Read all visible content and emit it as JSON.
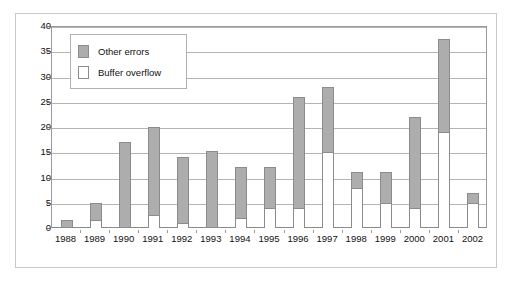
{
  "chart_data": {
    "type": "bar",
    "title": "",
    "xlabel": "",
    "ylabel": "",
    "stacked": true,
    "grid": true,
    "legend_position": "top-left-inside",
    "ylim": [
      0,
      40
    ],
    "ytick_step": 5,
    "yticks": [
      "0",
      "5",
      "10",
      "15",
      "20",
      "25",
      "30",
      "35",
      "40"
    ],
    "categories": [
      "1988",
      "1989",
      "1990",
      "1991",
      "1992",
      "1993",
      "1994",
      "1995",
      "1996",
      "1997",
      "1998",
      "1999",
      "2000",
      "2001",
      "2002"
    ],
    "series": [
      {
        "name": "Buffer overflow",
        "color": "#ffffff",
        "values": [
          0,
          1.5,
          0,
          2.5,
          1,
          0,
          2,
          4,
          4,
          15,
          8,
          5,
          4,
          19,
          5
        ]
      },
      {
        "name": "Other errors",
        "color": "#adadad",
        "values": [
          1.5,
          3.5,
          17,
          17.5,
          13,
          15.3,
          10,
          8,
          22,
          13,
          3,
          6,
          18,
          18.5,
          2
        ]
      }
    ],
    "totals": [
      1.5,
      5,
      17,
      20,
      14,
      15.3,
      12,
      12,
      26,
      28,
      11,
      11,
      22,
      37.5,
      7
    ]
  },
  "legend": {
    "items": [
      {
        "label": "Other errors",
        "swatch": "gray-swatch",
        "color": "#adadad"
      },
      {
        "label": "Buffer overflow",
        "swatch": "white-swatch",
        "color": "#ffffff"
      }
    ]
  },
  "colors": {
    "gray_fill": "#adadad",
    "white_fill": "#ffffff",
    "bar_outline": "#8c8c8c",
    "gridline": "#b4b4b4",
    "axis": "#9a9a9a",
    "frame": "#c9c9c9",
    "text": "#111111"
  }
}
